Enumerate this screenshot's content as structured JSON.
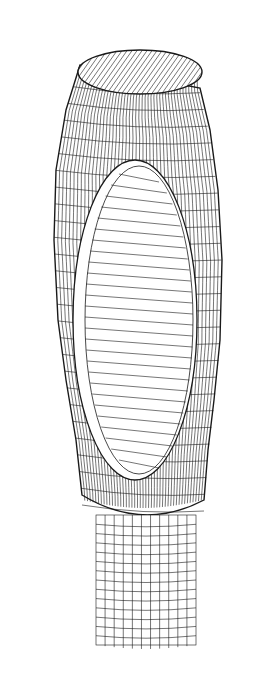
{
  "figure": {
    "kind": "wireframe-mesh",
    "colors": {
      "background": "#ffffff",
      "line": "#1a1a1a",
      "faint_line": "#444444"
    },
    "top_cap": {
      "cx": 140,
      "cy": 72,
      "rx": 62,
      "ry": 22,
      "hatch_angle_deg": -35
    },
    "body": {
      "left_outline": [
        [
          80,
          65
        ],
        [
          66,
          110
        ],
        [
          56,
          170
        ],
        [
          54,
          240
        ],
        [
          58,
          320
        ],
        [
          66,
          380
        ],
        [
          76,
          440
        ],
        [
          82,
          495
        ]
      ],
      "right_outline": [
        [
          200,
          88
        ],
        [
          210,
          130
        ],
        [
          218,
          190
        ],
        [
          222,
          260
        ],
        [
          220,
          340
        ],
        [
          214,
          400
        ],
        [
          208,
          450
        ],
        [
          204,
          500
        ]
      ],
      "bottom_y": 520,
      "horizontal_rings": 26,
      "vertical_lines": 44
    },
    "window": {
      "cx": 135,
      "cy": 320,
      "rx": 62,
      "ry": 160,
      "hatch_lines": 28
    },
    "neck": {
      "x": 96,
      "y": 515,
      "width": 100,
      "height": 130,
      "rings": 14,
      "columns": 11
    }
  }
}
